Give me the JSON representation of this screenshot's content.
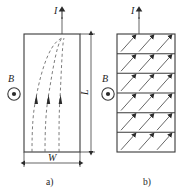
{
  "figure": {
    "title": "",
    "panels": [
      {
        "id": "panel-a",
        "caption": "a)",
        "current_label": "I",
        "field_label": "B",
        "field_symbol": "out-of-page-dot",
        "dim_width_label": "W",
        "dim_length_label": "L",
        "interior": "dashed-curved-current-streamlines",
        "streamline_count": 3,
        "streamline_arrow_direction": "up"
      },
      {
        "id": "panel-b",
        "caption": "b)",
        "current_label": "I",
        "field_label": "B",
        "field_symbol": "out-of-page-dot",
        "interior": "banded-diagonal-arrows",
        "band_count": 6,
        "arrows_per_band": 3,
        "arrow_direction": "up-right-diagonal"
      }
    ],
    "colors": {
      "line": "#3a3a3a",
      "dashed": "#6e6e6e",
      "text": "#1d1d1d",
      "background": "#ffffff"
    }
  }
}
